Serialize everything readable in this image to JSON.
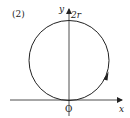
{
  "figure": {
    "label": "(2)",
    "axes": {
      "x_label": "x",
      "y_label": "y",
      "origin_label": "O",
      "y_tick_label": "2r"
    },
    "circle": {
      "description": "circle tangent to x-axis at origin, top at y=2r",
      "direction": "counterclockwise",
      "arrow_position": "right side, lower half"
    },
    "colors": {
      "stroke": "#222222",
      "background": "#ffffff"
    }
  }
}
